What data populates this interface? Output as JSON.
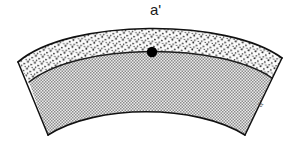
{
  "figure": {
    "title_label": "a'",
    "edge_label": "a''",
    "background_color": "#ffffff",
    "outline_color": "#111111",
    "point_marker_color": "#000000",
    "upper_band": {
      "name": "stippled-outer-band",
      "fill_pattern": "stipple-dots",
      "fill_color": "#f7f7f7",
      "dot_color": "#1a1a1a"
    },
    "lower_band": {
      "name": "crosshatch-inner-band",
      "fill_pattern": "fine-checker",
      "fill_color": "#d8d8d8",
      "hatch_color": "#7a7a7a"
    },
    "point_marker": {
      "name": "point-a-prime",
      "x": 152,
      "y": 52,
      "radius": 5
    }
  }
}
